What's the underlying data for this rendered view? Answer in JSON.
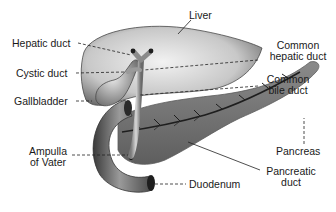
{
  "diagram": {
    "labels": {
      "liver": "Liver",
      "hepatic_duct": "Hepatic duct",
      "common_hepatic_duct_1": "Common",
      "common_hepatic_duct_2": "hepatic duct",
      "cystic_duct": "Cystic duct",
      "common_bile_duct_1": "Common",
      "common_bile_duct_2": "bile duct",
      "gallbladder": "Gallbladder",
      "pancreas": "Pancreas",
      "ampulla_1": "Ampulla",
      "ampulla_2": "of Vater",
      "pancreatic_duct_1": "Pancreatic",
      "pancreatic_duct_2": "duct",
      "duodenum": "Duodenum"
    },
    "colors": {
      "background": "#ffffff",
      "text": "#1a1a1a",
      "leader_line": "#222222",
      "organ_light": "#e6e6e6",
      "organ_dark": "#555555",
      "pancreas": "#7a7a7a"
    }
  }
}
